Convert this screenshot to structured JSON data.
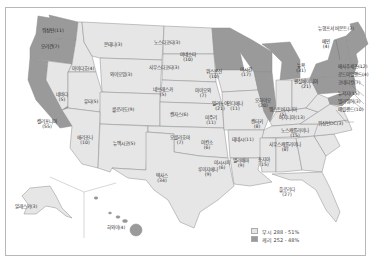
{
  "map": {
    "subject": "US Presidential Election Results by State",
    "colors": {
      "bush": "#e6e6e6",
      "kerry": "#9a9a9a",
      "border": "#8c8c8c",
      "background": "#ffffff"
    },
    "legend": [
      {
        "candidate": "부시",
        "electoral_votes": "288",
        "percent": "51%",
        "label": "부시 288 - 51%",
        "color": "#e6e6e6"
      },
      {
        "candidate": "케리",
        "electoral_votes": "252",
        "percent": "48%",
        "label": "케리 252 - 48%",
        "color": "#9a9a9a"
      }
    ],
    "states": [
      {
        "name": "워싱턴",
        "votes": "(11)",
        "winner": "kerry"
      },
      {
        "name": "오리건",
        "votes": "(7)",
        "winner": "kerry"
      },
      {
        "name": "캘리포니아",
        "votes": "(55)",
        "winner": "kerry"
      },
      {
        "name": "몬태나",
        "votes": "(3)",
        "winner": "bush"
      },
      {
        "name": "아이다호",
        "votes": "(4)",
        "winner": "bush"
      },
      {
        "name": "네바다",
        "votes": "(5)",
        "winner": "bush"
      },
      {
        "name": "와이오밍",
        "votes": "(3)",
        "winner": "bush"
      },
      {
        "name": "유타",
        "votes": "(5)",
        "winner": "bush"
      },
      {
        "name": "콜로라도",
        "votes": "(9)",
        "winner": "bush"
      },
      {
        "name": "애리조나",
        "votes": "(10)",
        "winner": "bush"
      },
      {
        "name": "뉴멕시코",
        "votes": "(5)",
        "winner": "bush"
      },
      {
        "name": "노스다코타",
        "votes": "(3)",
        "winner": "bush"
      },
      {
        "name": "사우스다코타",
        "votes": "(3)",
        "winner": "bush"
      },
      {
        "name": "네브래스카",
        "votes": "(5)",
        "winner": "bush"
      },
      {
        "name": "캔자스",
        "votes": "(6)",
        "winner": "bush"
      },
      {
        "name": "오클라호마",
        "votes": "(7)",
        "winner": "bush"
      },
      {
        "name": "텍사스",
        "votes": "(34)",
        "winner": "bush"
      },
      {
        "name": "미네소타",
        "votes": "(10)",
        "winner": "kerry"
      },
      {
        "name": "아이오와",
        "votes": "(7)",
        "winner": "bush"
      },
      {
        "name": "미주리",
        "votes": "(11)",
        "winner": "bush"
      },
      {
        "name": "아칸소",
        "votes": "(6)",
        "winner": "bush"
      },
      {
        "name": "루이지애나",
        "votes": "(9)",
        "winner": "bush"
      },
      {
        "name": "위스콘신",
        "votes": "(10)",
        "winner": "kerry"
      },
      {
        "name": "일리노이",
        "votes": "(21)",
        "winner": "kerry"
      },
      {
        "name": "미시간",
        "votes": "(17)",
        "winner": "kerry"
      },
      {
        "name": "인디애나",
        "votes": "(11)",
        "winner": "bush"
      },
      {
        "name": "오하이오",
        "votes": "(20)",
        "winner": "bush"
      },
      {
        "name": "켄터키",
        "votes": "(8)",
        "winner": "bush"
      },
      {
        "name": "테네시",
        "votes": "(11)",
        "winner": "bush"
      },
      {
        "name": "미시시피",
        "votes": "(6)",
        "winner": "bush"
      },
      {
        "name": "앨라배마",
        "votes": "(9)",
        "winner": "bush"
      },
      {
        "name": "조지아",
        "votes": "(15)",
        "winner": "bush"
      },
      {
        "name": "플로리다",
        "votes": "(27)",
        "winner": "bush"
      },
      {
        "name": "사우스캐롤라이나",
        "votes": "(8)",
        "winner": "bush"
      },
      {
        "name": "노스캐롤라이나",
        "votes": "(15)",
        "winner": "bush"
      },
      {
        "name": "버지니아",
        "votes": "(13)",
        "winner": "bush"
      },
      {
        "name": "웨스트버지니아",
        "votes": "(5)",
        "winner": "bush"
      },
      {
        "name": "펜실베이니아",
        "votes": "(21)",
        "winner": "kerry"
      },
      {
        "name": "뉴욕",
        "votes": "(31)",
        "winner": "kerry"
      },
      {
        "name": "메인",
        "votes": "(4)",
        "winner": "kerry"
      },
      {
        "name": "뉴햄프셔",
        "votes": "(4)",
        "winner": "kerry"
      },
      {
        "name": "버몬트",
        "votes": "(3)",
        "winner": "kerry"
      },
      {
        "name": "매사추세츠",
        "votes": "(12)",
        "winner": "kerry"
      },
      {
        "name": "로드아일랜드",
        "votes": "(4)",
        "winner": "kerry"
      },
      {
        "name": "코네티컷",
        "votes": "(7)",
        "winner": "kerry"
      },
      {
        "name": "뉴저지",
        "votes": "(15)",
        "winner": "kerry"
      },
      {
        "name": "델라웨어",
        "votes": "(3)",
        "winner": "kerry"
      },
      {
        "name": "메릴랜드",
        "votes": "(10)",
        "winner": "kerry"
      },
      {
        "name": "워싱턴DC",
        "votes": "(3)",
        "winner": "kerry"
      },
      {
        "name": "알래스카",
        "votes": "(3)",
        "winner": "bush"
      },
      {
        "name": "하와이",
        "votes": "(4)",
        "winner": "kerry"
      }
    ],
    "callouts": {
      "vt_nh": "뉴햄프셔 버몬트(3)",
      "ma": "매사추세츠(12)",
      "ri": "로드아일랜드(4)",
      "ct": "코네티컷(7)",
      "nj": "뉴저지(15)",
      "de": "델라웨어(3)",
      "md": "메릴랜드(10)",
      "dc": "워싱턴DC(3)"
    }
  }
}
